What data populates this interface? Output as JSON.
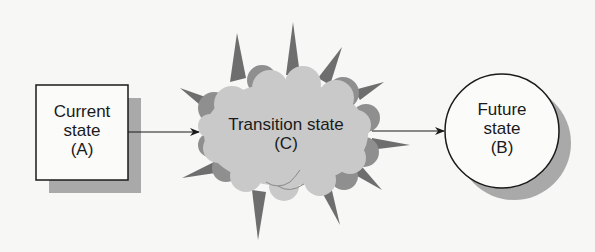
{
  "diagram": {
    "type": "state-transition",
    "colors": {
      "background": "#f7f7f5",
      "box_fill": "#fbfbfa",
      "stroke": "#1a1a1a",
      "shadow": "#a9a9a9",
      "cloud_fill": "#c9c9c9",
      "cloud_dark": "#8f8f8f",
      "spike": "#6e6e6e"
    },
    "nodes": {
      "current": {
        "line1": "Current",
        "line2": "state",
        "line3": "(A)",
        "shape": "rectangle"
      },
      "transition": {
        "line1": "Transition state",
        "line2": "(C)",
        "shape": "cloud-burst"
      },
      "future": {
        "line1": "Future",
        "line2": "state",
        "line3": "(B)",
        "shape": "circle"
      }
    },
    "edges": [
      {
        "from": "current",
        "to": "transition"
      },
      {
        "from": "transition",
        "to": "future"
      }
    ]
  }
}
